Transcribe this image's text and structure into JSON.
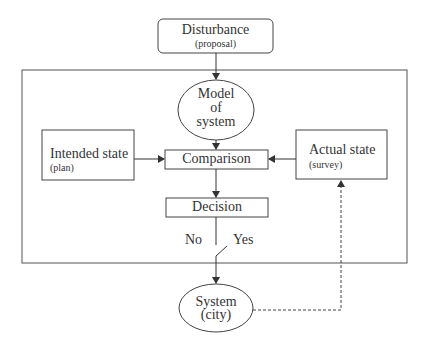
{
  "diagram": {
    "type": "control-loop flowchart",
    "nodes": {
      "disturbance": {
        "title": "Disturbance",
        "subtitle": "(proposal)",
        "shape": "rounded-rectangle"
      },
      "model": {
        "line1": "Model",
        "line2": "of",
        "line3": "system",
        "shape": "ellipse"
      },
      "intended": {
        "title": "Intended state",
        "subtitle": "(plan)",
        "shape": "rectangle"
      },
      "comparison": {
        "title": "Comparison",
        "shape": "rectangle"
      },
      "actual": {
        "title": "Actual state",
        "subtitle": "(survey)",
        "shape": "rectangle"
      },
      "decision": {
        "title": "Decision",
        "shape": "rectangle"
      },
      "system": {
        "line1": "System",
        "line2": "(city)",
        "shape": "ellipse"
      }
    },
    "switch": {
      "no_label": "No",
      "yes_label": "Yes"
    },
    "edges": [
      {
        "from": "disturbance",
        "to": "model",
        "style": "solid"
      },
      {
        "from": "model",
        "to": "comparison",
        "style": "solid"
      },
      {
        "from": "intended",
        "to": "comparison",
        "style": "solid"
      },
      {
        "from": "actual",
        "to": "comparison",
        "style": "solid"
      },
      {
        "from": "comparison",
        "to": "decision",
        "style": "solid"
      },
      {
        "from": "decision",
        "to": "system",
        "style": "solid",
        "via": "switch (Yes)"
      },
      {
        "from": "system",
        "to": "actual",
        "style": "dashed"
      }
    ],
    "colors": {
      "stroke": "#444444",
      "text": "#333333",
      "background": "#ffffff"
    }
  }
}
